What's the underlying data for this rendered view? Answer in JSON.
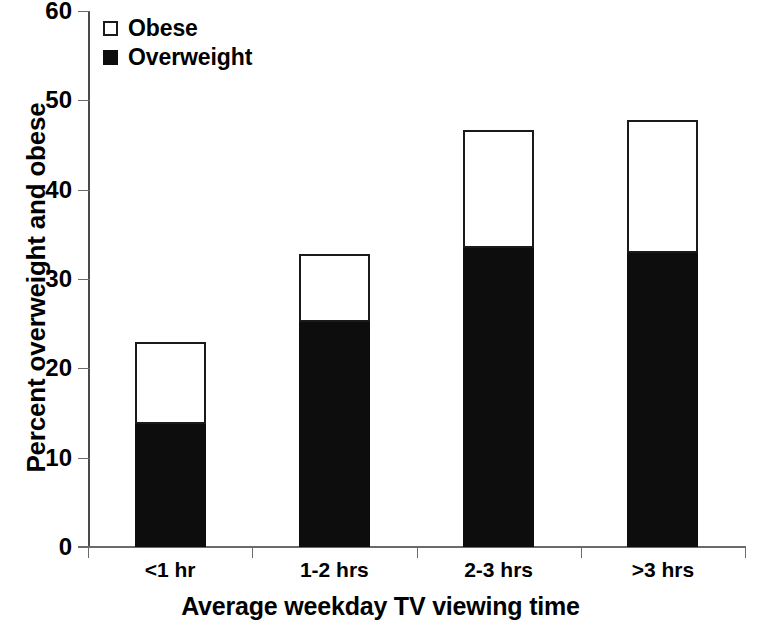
{
  "chart_data": {
    "type": "bar",
    "stacked": true,
    "title": "",
    "xlabel": "Average weekday TV viewing time",
    "ylabel": "Percent overweight and obese",
    "categories": [
      "<1 hr",
      "1-2 hrs",
      "2-3 hrs",
      ">3 hrs"
    ],
    "series": [
      {
        "name": "Overweight",
        "values": [
          13.8,
          25.2,
          33.5,
          32.9
        ],
        "color": "#0d0d0d"
      },
      {
        "name": "Obese",
        "values": [
          9.2,
          7.6,
          13.2,
          14.9
        ],
        "color": "#ffffff"
      }
    ],
    "totals": [
      23.0,
      32.8,
      46.7,
      47.8
    ],
    "ylim": [
      0,
      60
    ],
    "yticks": [
      0,
      10,
      20,
      30,
      40,
      50,
      60
    ],
    "ytick_labels": [
      "0",
      "10",
      "20",
      "30",
      "40",
      "50",
      "60"
    ],
    "grid": false,
    "legend_position": "top-left",
    "legend": [
      "Obese",
      "Overweight"
    ]
  },
  "axes": {
    "y_title": "Percent overweight and obese",
    "x_title": "Average weekday TV viewing time"
  },
  "legend": {
    "items": [
      {
        "label": "Obese",
        "swatch": "open-square"
      },
      {
        "label": "Overweight",
        "swatch": "filled-square"
      }
    ]
  }
}
